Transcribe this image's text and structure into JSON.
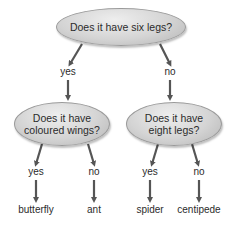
{
  "diagram": {
    "root": {
      "question": "Does it have six legs?"
    },
    "left": {
      "edge_label": "yes",
      "question_line1": "Does it have",
      "question_line2": "coloured wings?"
    },
    "right": {
      "edge_label": "no",
      "question_line1": "Does it have",
      "question_line2": "eight legs?"
    },
    "leaves": [
      {
        "edge_label": "yes",
        "answer": "butterfly"
      },
      {
        "edge_label": "no",
        "answer": "ant"
      },
      {
        "edge_label": "yes",
        "answer": "spider"
      },
      {
        "edge_label": "no",
        "answer": "centipede"
      }
    ]
  }
}
